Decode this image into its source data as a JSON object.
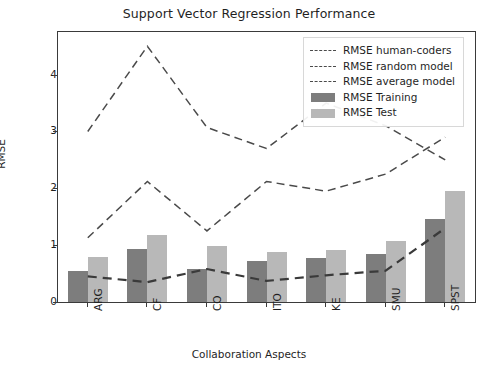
{
  "chart_data": {
    "type": "bar",
    "title": "Support Vector Regression Performance",
    "xlabel": "Collaboration Aspects",
    "ylabel": "RMSE",
    "categories": [
      "ARG",
      "CF",
      "CO",
      "ITO",
      "KE",
      "SMU",
      "SPST"
    ],
    "ylim": [
      0,
      4.75
    ],
    "yticks": [
      0,
      1,
      2,
      3,
      4
    ],
    "grid": false,
    "legend_position": "upper right",
    "series": [
      {
        "name": "RMSE human-coders",
        "type": "line",
        "style": "dashed",
        "color": "#4a4a4a",
        "values": [
          3.0,
          4.5,
          3.07,
          2.7,
          3.5,
          3.1,
          2.5
        ]
      },
      {
        "name": "RMSE random model",
        "type": "line",
        "style": "dashed",
        "color": "#4a4a4a",
        "values": [
          1.13,
          2.12,
          1.25,
          2.12,
          1.95,
          2.25,
          2.9
        ]
      },
      {
        "name": "RMSE average model",
        "type": "line",
        "style": "dashed",
        "color": "#3a3a3a",
        "values": [
          0.45,
          0.35,
          0.58,
          0.37,
          0.47,
          0.55,
          1.3
        ]
      },
      {
        "name": "RMSE Training",
        "type": "bar",
        "color": "#7d7d7d",
        "values": [
          0.55,
          0.93,
          0.58,
          0.72,
          0.78,
          0.84,
          1.46
        ]
      },
      {
        "name": "RMSE Test",
        "type": "bar",
        "color": "#b8b8b8",
        "values": [
          0.79,
          1.18,
          0.99,
          0.88,
          0.92,
          1.08,
          1.95
        ]
      }
    ]
  },
  "legend": {
    "items": [
      {
        "label": "RMSE human-coders",
        "key": "dash"
      },
      {
        "label": "RMSE random model",
        "key": "dash"
      },
      {
        "label": "RMSE average model",
        "key": "dash"
      },
      {
        "label": "RMSE Training",
        "key": "swatch-train"
      },
      {
        "label": "RMSE Test",
        "key": "swatch-test"
      }
    ]
  }
}
